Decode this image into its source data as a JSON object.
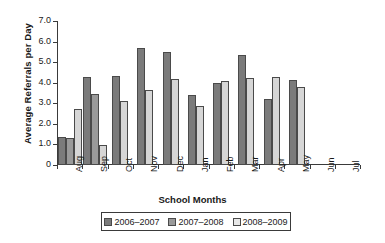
{
  "chart_data": {
    "type": "bar",
    "title": "",
    "xlabel": "School Months",
    "ylabel": "Average Referrals per Day",
    "categories": [
      "Aug",
      "Sep",
      "Oct",
      "Nov",
      "Dec",
      "Jan",
      "Feb",
      "Mar",
      "Apr",
      "May",
      "Jun",
      "Jul"
    ],
    "ylim": [
      0,
      7.0
    ],
    "ytick_labels": [
      "0",
      "1.0",
      "2.0",
      "3.0",
      "4.0",
      "5.0",
      "6.0",
      "7.0"
    ],
    "ytick_values": [
      0,
      1.0,
      2.0,
      3.0,
      4.0,
      5.0,
      6.0,
      7.0
    ],
    "grid": false,
    "legend_position": "bottom",
    "series": [
      {
        "name": "2006–2007",
        "color": "#7b7b7b",
        "values": [
          1.35,
          4.3,
          4.35,
          5.7,
          5.5,
          3.4,
          4.0,
          5.35,
          3.2,
          4.15,
          null,
          null
        ]
      },
      {
        "name": "2007–2008",
        "color": "#9a9a9a",
        "values": [
          1.3,
          3.45,
          null,
          null,
          null,
          null,
          null,
          null,
          null,
          null,
          null,
          null
        ]
      },
      {
        "name": "2008–2009",
        "color": "#d6d6d6",
        "values": [
          2.7,
          0.95,
          3.1,
          3.65,
          4.2,
          2.85,
          4.1,
          4.25,
          4.3,
          3.8,
          null,
          null
        ]
      }
    ]
  }
}
